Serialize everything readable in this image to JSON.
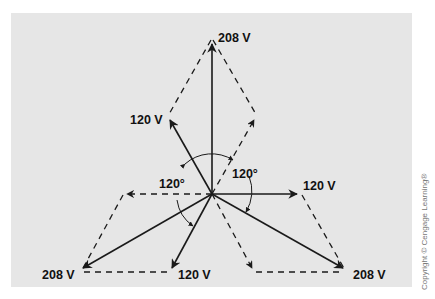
{
  "figure": {
    "background_color": "#e6e6e6",
    "line_color": "#1a1a1a",
    "labels": {
      "top_resultant": "208 V",
      "upper_left_phase": "120 V",
      "right_phase": "120 V",
      "bottom_phase": "120 V",
      "bottom_left_resultant": "208 V",
      "bottom_right_resultant": "208 V",
      "angle_left": "120°",
      "angle_right": "120°"
    },
    "copyright": "Copyright © Cengage Learning®"
  }
}
